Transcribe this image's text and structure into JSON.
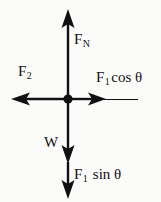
{
  "figure": {
    "type": "force-vector-diagram",
    "background_color": "#fbfbfa",
    "stroke_color": "#111111",
    "origin": {
      "x": 68,
      "y": 99,
      "label": "pivot point"
    }
  },
  "vectors": [
    {
      "name": "normal-force",
      "direction": "up",
      "label_base": "F",
      "label_sub": "N",
      "from": {
        "x": 68,
        "y": 99
      },
      "to": {
        "x": 68,
        "y": 10
      }
    },
    {
      "name": "force-two",
      "direction": "left",
      "label_base": "F",
      "label_sub": "2",
      "from": {
        "x": 68,
        "y": 99
      },
      "to": {
        "x": 12,
        "y": 99
      }
    },
    {
      "name": "force-one-cosine-component",
      "direction": "right",
      "label_base": "F",
      "label_sub": "1",
      "label_tail": "cos θ",
      "from": {
        "x": 68,
        "y": 99
      },
      "to": {
        "x": 105,
        "y": 99
      },
      "line_extends_to": {
        "x": 138,
        "y": 99
      }
    },
    {
      "name": "weight",
      "direction": "down",
      "label_base": "W",
      "label_sub": "",
      "from": {
        "x": 68,
        "y": 99
      },
      "to": {
        "x": 68,
        "y": 162
      }
    },
    {
      "name": "force-one-sine-component",
      "direction": "down",
      "label_base": "F",
      "label_sub": "1",
      "label_tail": "sin θ",
      "from": {
        "x": 68,
        "y": 162
      },
      "to": {
        "x": 68,
        "y": 198
      }
    }
  ],
  "labels": {
    "normal_force": {
      "base": "F",
      "sub": "N"
    },
    "force_two": {
      "base": "F",
      "sub": "2"
    },
    "force_one_cos": {
      "base": "F",
      "sub": "1",
      "tail": "cos θ"
    },
    "weight": {
      "base": "W"
    },
    "force_one_sin": {
      "base": "F",
      "sub": "1",
      "tail": "sin θ"
    }
  }
}
